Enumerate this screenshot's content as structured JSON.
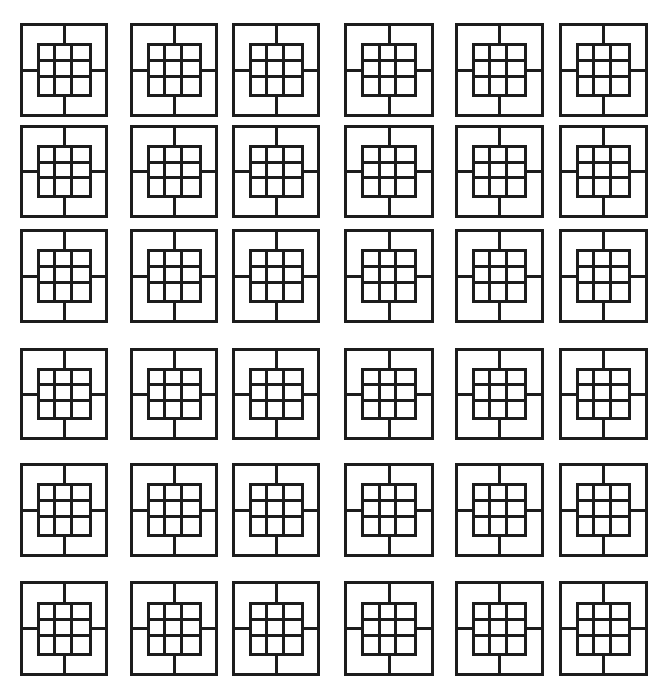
{
  "figure": {
    "rows": 6,
    "cols": 6,
    "stroke_color": "#1c1c1c",
    "background": "#ffffff",
    "inner_grid": {
      "rows": 3,
      "cols": 3
    },
    "col_x": [
      20,
      130,
      232,
      344,
      455,
      559
    ],
    "col_w": [
      88,
      88,
      88,
      90,
      89,
      89
    ],
    "row_y": [
      23,
      125,
      229,
      348,
      463,
      581
    ],
    "row_h": [
      94,
      93,
      94,
      92,
      94,
      95
    ]
  }
}
